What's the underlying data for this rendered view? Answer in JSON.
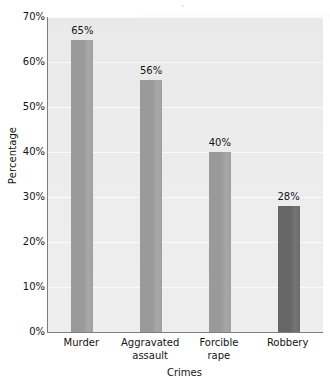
{
  "chart_data": {
    "type": "bar",
    "title": "",
    "categories": [
      "Murder",
      "Aggravated assault",
      "Forcible rape",
      "Robbery"
    ],
    "values": [
      65,
      56,
      40,
      28
    ],
    "value_labels": [
      "65%",
      "56%",
      "40%",
      "28%"
    ],
    "xlabel": "Crimes",
    "ylabel": "Percentage",
    "ylim": [
      0,
      70
    ],
    "ytick_labels": [
      "0%",
      "10%",
      "20%",
      "30%",
      "40%",
      "50%",
      "60%",
      "70%"
    ],
    "ytick_values": [
      0,
      10,
      20,
      30,
      40,
      50,
      60,
      70
    ],
    "grid": true,
    "grid_axis": "y",
    "legend": false,
    "bar_colors": [
      "#9a9a9a",
      "#9a9a9a",
      "#9a9a9a",
      "#666666"
    ],
    "plot_background": "#ececec",
    "axis_color": "#7d7d7d",
    "gridline_color": "#fbfbfb",
    "text_color": "#141414"
  },
  "xtick_lines": [
    [
      "Murder"
    ],
    [
      "Aggravated",
      "assault"
    ],
    [
      "Forcible",
      "rape"
    ],
    [
      "Robbery"
    ]
  ]
}
